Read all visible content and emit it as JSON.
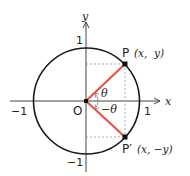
{
  "diagram": {
    "colors": {
      "axis": "#444444",
      "circle": "#1a1a1a",
      "radius": "#e8534a",
      "guide": "#999999",
      "point": "#111111"
    },
    "axes": {
      "x_label": "x",
      "y_label": "y",
      "tick_x_neg": "−1",
      "tick_x_pos": "1",
      "tick_y_pos": "1",
      "tick_y_neg": "−1"
    },
    "origin_label": "O",
    "points": [
      {
        "name": "P",
        "coords": "(x,  y)"
      },
      {
        "name": "P′",
        "coords": "(x, −y)"
      }
    ],
    "angles": [
      {
        "label": "θ"
      },
      {
        "label": "−θ"
      }
    ]
  }
}
